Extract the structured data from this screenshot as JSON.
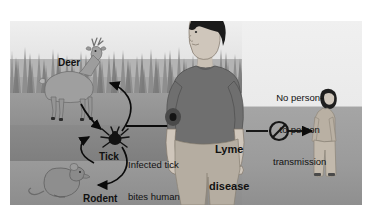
{
  "figure": {
    "type": "illustrated-diagram",
    "frame": {
      "x": 10,
      "y": 21,
      "width": 352,
      "height": 184
    },
    "palette": {
      "background": "#ffffff",
      "sky": "#efefef",
      "grass": "#b4b4b4",
      "ground_mid": "#8f8f8f",
      "ground_dark": "#7e7e7e",
      "right_panel": "#eaeaea",
      "shirt": "#6f6f6f",
      "skin": "#cfc6bb",
      "hair": "#1d1d1d",
      "deer": "#9a9a9a",
      "rodent": "#8a8a8a",
      "tick": "#141414",
      "arrow": "#0b0b0b",
      "label_text": "#111111"
    }
  },
  "labels": {
    "deer": "Deer",
    "tick": "Tick",
    "rodent": "Rodent",
    "infected_bite_line1": "Infected tick",
    "infected_bite_line2": "bites human",
    "lyme_line1": "Lyme",
    "lyme_line2": "disease",
    "no_transmission_line1": "No person-",
    "no_transmission_line2": "to-person",
    "no_transmission_line3": "transmission"
  },
  "elements": {
    "deer_figure": "deer-illustration",
    "rodent_figure": "rodent-illustration",
    "tick_figure": "tick-illustration",
    "man_figure": "infected-man-illustration",
    "woman_figure": "distant-woman-illustration",
    "bite_mark": "tick-bite-mark",
    "prohibition_sign": "no-transmission-sign",
    "grass_background": "tall-grass-silhouette"
  },
  "arrows": [
    {
      "name": "tick-to-deer",
      "style": "curved",
      "direction": "up-left",
      "meaning": "tick feeds on deer"
    },
    {
      "name": "deer-to-tick",
      "style": "curved",
      "direction": "down-right",
      "meaning": "deer hosts tick"
    },
    {
      "name": "tick-to-rodent",
      "style": "curved",
      "direction": "down-left",
      "meaning": "tick feeds on rodent"
    },
    {
      "name": "rodent-to-tick",
      "style": "curved",
      "direction": "up-right",
      "meaning": "rodent hosts tick"
    },
    {
      "name": "tick-to-human",
      "style": "straight",
      "direction": "right",
      "meaning": "infected tick bites human"
    },
    {
      "name": "human-to-person",
      "style": "straight",
      "direction": "right",
      "meaning": "blocked: no person-to-person transmission"
    }
  ]
}
